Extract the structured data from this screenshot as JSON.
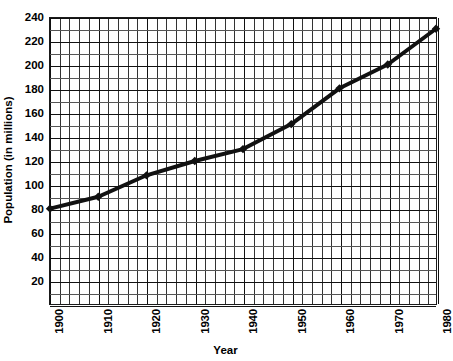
{
  "chart_data": {
    "type": "line",
    "title": "",
    "xlabel": "Year",
    "ylabel": "Population (in millions)",
    "x": [
      1900,
      1910,
      1920,
      1930,
      1940,
      1950,
      1960,
      1970,
      1980
    ],
    "values": [
      80,
      90,
      108,
      120,
      130,
      151,
      181,
      201,
      231
    ],
    "categories": [
      "1900",
      "1910",
      "1920",
      "1930",
      "1940",
      "1950",
      "1960",
      "1970",
      "1980"
    ],
    "xlim": [
      1900,
      1980
    ],
    "ylim": [
      0,
      240
    ],
    "x_tick_labels": [
      "1900",
      "1910",
      "1920",
      "1930",
      "1940",
      "1950",
      "1960",
      "1970",
      "1980"
    ],
    "x_tick_values": [
      1900,
      1910,
      1920,
      1930,
      1940,
      1950,
      1960,
      1970,
      1980
    ],
    "x_minor_step": 2,
    "y_tick_labels": [
      "240",
      "220",
      "200",
      "180",
      "160",
      "140",
      "120",
      "100",
      "80",
      "60",
      "40",
      "20"
    ],
    "y_tick_values": [
      240,
      220,
      200,
      180,
      160,
      140,
      120,
      100,
      80,
      60,
      40,
      20
    ],
    "y_minor_step": 10,
    "grid": true,
    "legend": null,
    "series_color": "#111111",
    "grid_color": "#333333",
    "marker": "diamond",
    "line_width": 4
  },
  "axes": {
    "y_title": "Population (in millions)",
    "x_title": "Year"
  }
}
